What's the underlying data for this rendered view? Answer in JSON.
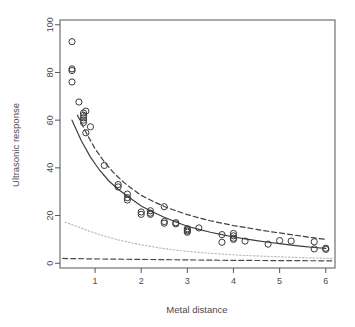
{
  "chart_data": {
    "type": "scatter",
    "title": "",
    "xlabel": "Metal distance",
    "ylabel": "Ultrasonic response",
    "xlim": [
      0.24,
      6.2
    ],
    "ylim": [
      -2,
      102
    ],
    "xticks": [
      1,
      2,
      3,
      4,
      5,
      6
    ],
    "yticks": [
      0,
      20,
      40,
      60,
      80,
      100
    ],
    "grid": false,
    "legend": "none",
    "points": [
      {
        "x": 0.5,
        "y": 92.9
      },
      {
        "x": 0.5,
        "y": 81.5
      },
      {
        "x": 0.5,
        "y": 80.8
      },
      {
        "x": 0.5,
        "y": 76.0
      },
      {
        "x": 0.65,
        "y": 67.6
      },
      {
        "x": 0.75,
        "y": 63.0
      },
      {
        "x": 0.75,
        "y": 62.0
      },
      {
        "x": 0.75,
        "y": 61.0
      },
      {
        "x": 0.75,
        "y": 60.0
      },
      {
        "x": 0.75,
        "y": 59.0
      },
      {
        "x": 0.8,
        "y": 63.8
      },
      {
        "x": 0.8,
        "y": 54.7
      },
      {
        "x": 0.9,
        "y": 57.2
      },
      {
        "x": 1.2,
        "y": 41.0
      },
      {
        "x": 1.5,
        "y": 33.0
      },
      {
        "x": 1.5,
        "y": 32.0
      },
      {
        "x": 1.7,
        "y": 29.0
      },
      {
        "x": 1.7,
        "y": 27.5
      },
      {
        "x": 1.7,
        "y": 26.5
      },
      {
        "x": 2.0,
        "y": 21.5
      },
      {
        "x": 2.0,
        "y": 20.5
      },
      {
        "x": 2.2,
        "y": 22.0
      },
      {
        "x": 2.2,
        "y": 21.0
      },
      {
        "x": 2.2,
        "y": 20.5
      },
      {
        "x": 2.5,
        "y": 23.7
      },
      {
        "x": 2.5,
        "y": 17.5
      },
      {
        "x": 2.5,
        "y": 16.8
      },
      {
        "x": 2.75,
        "y": 17.0
      },
      {
        "x": 2.75,
        "y": 16.5
      },
      {
        "x": 3.0,
        "y": 14.5
      },
      {
        "x": 3.0,
        "y": 14.0
      },
      {
        "x": 3.0,
        "y": 13.5
      },
      {
        "x": 3.0,
        "y": 13.0
      },
      {
        "x": 3.25,
        "y": 14.8
      },
      {
        "x": 3.75,
        "y": 12.0
      },
      {
        "x": 3.75,
        "y": 8.8
      },
      {
        "x": 4.0,
        "y": 12.5
      },
      {
        "x": 4.0,
        "y": 11.5
      },
      {
        "x": 4.0,
        "y": 10.5
      },
      {
        "x": 4.0,
        "y": 10.0
      },
      {
        "x": 4.25,
        "y": 9.3
      },
      {
        "x": 4.75,
        "y": 8.0
      },
      {
        "x": 5.0,
        "y": 9.5
      },
      {
        "x": 5.25,
        "y": 9.3
      },
      {
        "x": 5.75,
        "y": 6.0
      },
      {
        "x": 5.75,
        "y": 9.0
      },
      {
        "x": 6.0,
        "y": 6.3
      },
      {
        "x": 6.0,
        "y": 5.8
      }
    ],
    "curves": [
      {
        "name": "fitted-solid",
        "style": "solid",
        "color": "#3f3f3f",
        "points": [
          {
            "x": 0.5,
            "y": 60.0
          },
          {
            "x": 0.7,
            "y": 51.5
          },
          {
            "x": 0.9,
            "y": 44.5
          },
          {
            "x": 1.1,
            "y": 39.0
          },
          {
            "x": 1.3,
            "y": 34.5
          },
          {
            "x": 1.5,
            "y": 31.0
          },
          {
            "x": 1.75,
            "y": 27.5
          },
          {
            "x": 2.0,
            "y": 24.0
          },
          {
            "x": 2.25,
            "y": 21.5
          },
          {
            "x": 2.5,
            "y": 19.3
          },
          {
            "x": 2.75,
            "y": 17.3
          },
          {
            "x": 3.0,
            "y": 15.5
          },
          {
            "x": 3.25,
            "y": 14.2
          },
          {
            "x": 3.5,
            "y": 13.0
          },
          {
            "x": 3.75,
            "y": 12.0
          },
          {
            "x": 4.0,
            "y": 11.0
          },
          {
            "x": 4.25,
            "y": 10.2
          },
          {
            "x": 4.5,
            "y": 9.5
          },
          {
            "x": 4.75,
            "y": 8.8
          },
          {
            "x": 5.0,
            "y": 8.2
          },
          {
            "x": 5.25,
            "y": 7.6
          },
          {
            "x": 5.5,
            "y": 7.1
          },
          {
            "x": 5.75,
            "y": 6.6
          },
          {
            "x": 6.0,
            "y": 6.2
          }
        ]
      },
      {
        "name": "upper-dashed",
        "style": "dashed",
        "color": "#3f3f3f",
        "points": [
          {
            "x": 0.62,
            "y": 62.0
          },
          {
            "x": 0.8,
            "y": 55.0
          },
          {
            "x": 1.0,
            "y": 48.0
          },
          {
            "x": 1.2,
            "y": 42.5
          },
          {
            "x": 1.4,
            "y": 38.0
          },
          {
            "x": 1.6,
            "y": 34.3
          },
          {
            "x": 1.8,
            "y": 31.2
          },
          {
            "x": 2.0,
            "y": 28.5
          },
          {
            "x": 2.25,
            "y": 26.0
          },
          {
            "x": 2.5,
            "y": 23.8
          },
          {
            "x": 2.75,
            "y": 22.0
          },
          {
            "x": 3.0,
            "y": 20.4
          },
          {
            "x": 3.25,
            "y": 19.0
          },
          {
            "x": 3.5,
            "y": 17.8
          },
          {
            "x": 3.75,
            "y": 16.8
          },
          {
            "x": 4.0,
            "y": 15.8
          },
          {
            "x": 4.25,
            "y": 15.0
          },
          {
            "x": 4.5,
            "y": 14.2
          },
          {
            "x": 4.75,
            "y": 13.4
          },
          {
            "x": 5.0,
            "y": 12.7
          },
          {
            "x": 5.25,
            "y": 12.0
          },
          {
            "x": 5.5,
            "y": 11.3
          },
          {
            "x": 5.75,
            "y": 10.6
          },
          {
            "x": 6.0,
            "y": 10.0
          }
        ]
      },
      {
        "name": "lower-dotted",
        "style": "dotted",
        "color": "#b8b8b8",
        "points": [
          {
            "x": 0.35,
            "y": 17.2
          },
          {
            "x": 0.6,
            "y": 15.5
          },
          {
            "x": 0.9,
            "y": 13.3
          },
          {
            "x": 1.2,
            "y": 11.4
          },
          {
            "x": 1.5,
            "y": 9.8
          },
          {
            "x": 1.8,
            "y": 8.5
          },
          {
            "x": 2.1,
            "y": 7.4
          },
          {
            "x": 2.4,
            "y": 6.4
          },
          {
            "x": 2.7,
            "y": 5.6
          },
          {
            "x": 3.0,
            "y": 5.0
          },
          {
            "x": 3.4,
            "y": 4.3
          },
          {
            "x": 3.8,
            "y": 3.8
          },
          {
            "x": 4.2,
            "y": 3.3
          },
          {
            "x": 4.6,
            "y": 3.0
          },
          {
            "x": 5.0,
            "y": 2.7
          },
          {
            "x": 5.4,
            "y": 2.4
          },
          {
            "x": 5.8,
            "y": 2.2
          },
          {
            "x": 6.15,
            "y": 2.0
          }
        ]
      },
      {
        "name": "baseline-dashed",
        "style": "dashed",
        "color": "#4a4a4a",
        "points": [
          {
            "x": 0.3,
            "y": 2.0
          },
          {
            "x": 1.0,
            "y": 1.8
          },
          {
            "x": 2.0,
            "y": 1.6
          },
          {
            "x": 3.0,
            "y": 1.4
          },
          {
            "x": 4.0,
            "y": 1.2
          },
          {
            "x": 5.0,
            "y": 1.1
          },
          {
            "x": 6.15,
            "y": 1.0
          }
        ]
      }
    ]
  }
}
